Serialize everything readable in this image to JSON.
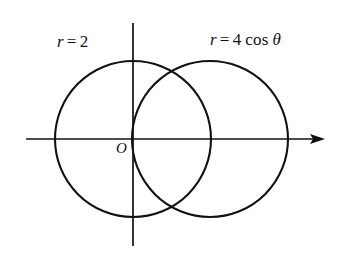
{
  "figure": {
    "kind": "polar-coordinate-diagram",
    "background_color": "#ffffff",
    "stroke_color": "#111111",
    "width": 341,
    "height": 261
  },
  "axes": {
    "origin_label": "O",
    "x_axis": {
      "name": "horizontal-polar-axis",
      "y": 139,
      "x_start": 26,
      "x_end": 325,
      "arrow_at": "right"
    },
    "y_axis": {
      "name": "vertical-axis",
      "x": 133,
      "y_start": 23,
      "y_end": 246,
      "arrow_at": "none"
    }
  },
  "labels": {
    "left_curve": {
      "full_text": "r = 2",
      "r_symbol": "r",
      "equals": "=",
      "value": "2"
    },
    "right_curve": {
      "full_text": "r = 4 cos θ",
      "r_symbol": "r",
      "equals": "=",
      "coefficient": "4",
      "function": "cos",
      "angle_symbol": "θ"
    }
  },
  "chart_data": {
    "type": "line",
    "title": "",
    "xlabel": "",
    "ylabel": "",
    "coordinate_system": "polar",
    "grid": false,
    "legend": "inline-annotations",
    "series": [
      {
        "name": "r = 2",
        "equation": "r = 2",
        "shape": "circle",
        "center_px": [
          133,
          139
        ],
        "radius_px": 78,
        "center_polar": [
          0,
          0
        ],
        "radius_units": 2,
        "x_intercepts_px": [
          55,
          211
        ],
        "y_extent_px": [
          61,
          217
        ]
      },
      {
        "name": "r = 4 cos θ",
        "equation": "r = 4 cos θ",
        "shape": "circle",
        "center_px": [
          210,
          139
        ],
        "radius_px": 78,
        "center_polar": [
          2,
          0
        ],
        "radius_units": 2,
        "x_intercepts_px": [
          132,
          288
        ],
        "y_extent_px": [
          61,
          217
        ]
      }
    ],
    "intersections_px": [
      [
        172,
        68
      ],
      [
        172,
        211
      ]
    ],
    "intersections_polar": [
      {
        "r": 2,
        "theta": "π/3"
      },
      {
        "r": 2,
        "theta": "-π/3"
      }
    ],
    "xlim_px": [
      26,
      325
    ],
    "ylim_px": [
      23,
      246
    ]
  }
}
